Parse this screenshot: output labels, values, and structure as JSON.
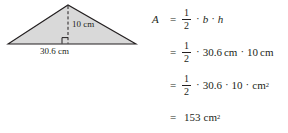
{
  "figure": {
    "shape": "triangle",
    "fill_color": "#d9d9d9",
    "stroke_color": "#231f20",
    "height_label": "10 cm",
    "base_label": "30.6 cm",
    "height_line_style": "dashed",
    "right_angle_marker": true
  },
  "equations": {
    "line1": {
      "lhs": "A",
      "equals": "=",
      "fraction": {
        "numerator": "1",
        "denominator": "2"
      },
      "dot1": "·",
      "term1": "b",
      "dot2": "·",
      "term2": "h"
    },
    "line2": {
      "equals": "=",
      "fraction": {
        "numerator": "1",
        "denominator": "2"
      },
      "dot1": "·",
      "term1": "30.6",
      "unit1": "cm",
      "dot2": "·",
      "term2": "10",
      "unit2": "cm"
    },
    "line3": {
      "equals": "=",
      "fraction": {
        "numerator": "1",
        "denominator": "2"
      },
      "dot1": "·",
      "term1": "30.6",
      "dot2": "·",
      "term2": "10",
      "dot3": "·",
      "unit": "cm",
      "exponent": "2"
    },
    "line4": {
      "equals": "=",
      "result": "153",
      "unit": "cm",
      "exponent": "2"
    }
  }
}
